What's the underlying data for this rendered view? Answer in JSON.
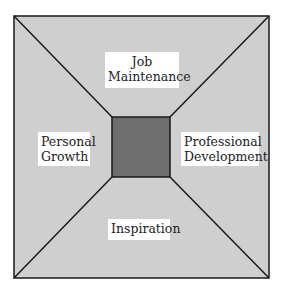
{
  "diagram": {
    "colors": {
      "outer_fill": "#cfcfcf",
      "inner_fill": "#6e6e6e",
      "stroke": "#1a1a1a",
      "label_bg": "#ffffff"
    },
    "regions": {
      "top": {
        "lines": [
          "Job",
          "Maintenance"
        ]
      },
      "left": {
        "lines": [
          "Personal",
          "Growth"
        ]
      },
      "right": {
        "lines": [
          "Professional",
          "Development"
        ]
      },
      "bottom": {
        "lines": [
          "Inspiration"
        ]
      }
    }
  }
}
